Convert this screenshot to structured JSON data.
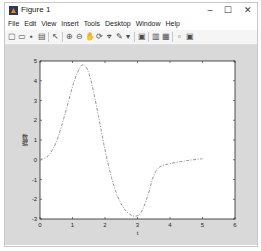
{
  "window": {
    "title": "Figure 1",
    "controls": {
      "minimize": "–",
      "maximize": "☐",
      "close": "✕"
    }
  },
  "menubar": {
    "items": [
      "File",
      "Edit",
      "View",
      "Insert",
      "Tools",
      "Desktop",
      "Window",
      "Help"
    ]
  },
  "toolbar": {
    "buttons": [
      {
        "name": "new-figure-icon",
        "glyph": "▢"
      },
      {
        "name": "open-file-icon",
        "glyph": "▭"
      },
      {
        "name": "save-icon",
        "glyph": "▪"
      },
      {
        "name": "print-icon",
        "glyph": "▤"
      },
      {
        "name": "edit-plot-arrow-icon",
        "glyph": "↖"
      },
      {
        "name": "zoom-in-icon",
        "glyph": "⊕"
      },
      {
        "name": "zoom-out-icon",
        "glyph": "⊖"
      },
      {
        "name": "pan-icon",
        "glyph": "✋"
      },
      {
        "name": "rotate-3d-icon",
        "glyph": "⟳"
      },
      {
        "name": "data-cursor-icon",
        "glyph": "⌖"
      },
      {
        "name": "brush-icon",
        "glyph": "✎"
      },
      {
        "name": "brush-dropdown-icon",
        "glyph": "▾"
      },
      {
        "name": "link-plot-icon",
        "glyph": "▣"
      },
      {
        "name": "insert-colorbar-icon",
        "glyph": "▥"
      },
      {
        "name": "insert-legend-icon",
        "glyph": "▦"
      },
      {
        "name": "hide-plot-tools-icon",
        "glyph": "▫"
      },
      {
        "name": "show-plot-tools-icon",
        "glyph": "▣"
      }
    ]
  },
  "chart_data": {
    "type": "line",
    "title": "",
    "xlabel": "t",
    "ylabel": "数据",
    "xlim": [
      0,
      6
    ],
    "ylim": [
      -3,
      5
    ],
    "xticks": [
      0,
      1,
      2,
      3,
      4,
      5,
      6
    ],
    "yticks": [
      -3,
      -2,
      -1,
      0,
      1,
      2,
      3,
      4,
      5
    ],
    "grid": false,
    "line_style": "dash-dot",
    "line_color": "#888888",
    "series": [
      {
        "name": "y",
        "x": [
          0,
          0.25,
          0.5,
          0.75,
          1.0,
          1.15,
          1.3,
          1.45,
          1.6,
          1.8,
          2.0,
          2.2,
          2.4,
          2.6,
          2.8,
          2.95,
          3.1,
          3.3,
          3.5,
          3.7,
          4.0,
          4.5,
          5.0
        ],
        "y": [
          0,
          0.2,
          0.9,
          2.2,
          3.7,
          4.4,
          4.8,
          4.6,
          3.8,
          2.2,
          0.5,
          -0.9,
          -1.9,
          -2.5,
          -2.8,
          -2.85,
          -2.7,
          -1.9,
          -0.8,
          -0.35,
          -0.2,
          -0.05,
          0.05
        ]
      }
    ]
  }
}
